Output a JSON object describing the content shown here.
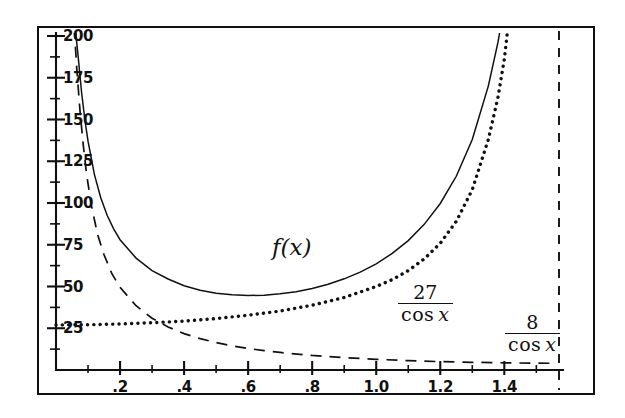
{
  "figure": {
    "kind": "function-plot",
    "background": "#ffffff",
    "ink_color": "#111111"
  },
  "annotations": {
    "fx": "f(x)",
    "curve27": {
      "numerator": "27",
      "denominator_fn": "cos",
      "denominator_var": "x"
    },
    "curve8": {
      "numerator": "8",
      "denominator_fn": "cos",
      "denominator_var": "x"
    }
  },
  "chart_data": {
    "type": "line",
    "title": "",
    "xlabel": "",
    "ylabel": "",
    "xlim": [
      0.0,
      1.5708
    ],
    "ylim": [
      0,
      205
    ],
    "grid": false,
    "legend": "inline-annotations",
    "x_ticks_major": [
      0.2,
      0.4,
      0.6,
      0.8,
      1.0,
      1.2,
      1.4
    ],
    "x_ticklabels": [
      ".2",
      ".4",
      ".6",
      ".8",
      "1.0",
      "1.2",
      "1.4"
    ],
    "x_ticks_minor": [
      0.1,
      0.3,
      0.5,
      0.7,
      0.9,
      1.1,
      1.3,
      1.5
    ],
    "y_ticks_major": [
      25,
      50,
      75,
      100,
      125,
      150,
      175,
      200
    ],
    "y_ticklabels": [
      "25",
      "50",
      "75",
      "100",
      "125",
      "150",
      "175",
      "200"
    ],
    "y_ticks_minor": [
      12.5,
      37.5,
      62.5,
      87.5,
      112.5,
      137.5,
      162.5,
      187.5
    ],
    "asymptote_x": 1.5708,
    "series": [
      {
        "name": "f(x)",
        "style": "solid",
        "label": "f(x)",
        "label_at": {
          "x": 0.73,
          "y": 72
        },
        "x": [
          0.06,
          0.07,
          0.08,
          0.09,
          0.1,
          0.12,
          0.14,
          0.16,
          0.18,
          0.2,
          0.25,
          0.3,
          0.35,
          0.4,
          0.45,
          0.5,
          0.55,
          0.6,
          0.65,
          0.7,
          0.75,
          0.8,
          0.85,
          0.9,
          0.95,
          1.0,
          1.05,
          1.1,
          1.15,
          1.2,
          1.25,
          1.3,
          1.35,
          1.38,
          1.4,
          1.42,
          1.44,
          1.45,
          1.46,
          1.47
        ],
        "y": [
          205.0,
          186.0,
          166.0,
          150.0,
          137.0,
          117.0,
          103.0,
          92.5,
          84.5,
          78.0,
          67.0,
          59.5,
          54.5,
          50.5,
          47.8,
          46.0,
          45.0,
          44.6,
          44.8,
          45.6,
          46.9,
          48.8,
          51.3,
          54.6,
          58.6,
          63.6,
          69.8,
          77.5,
          87.2,
          99.7,
          116.0,
          138.0,
          170.0,
          196.0,
          218.0,
          245.0,
          280.0,
          300.0,
          330.0,
          370.0
        ]
      },
      {
        "name": "27/cos(x)",
        "style": "dotted",
        "label": "27/cos x",
        "label_at": {
          "x": 1.17,
          "y": 38
        },
        "x": [
          0.0,
          0.1,
          0.2,
          0.3,
          0.4,
          0.5,
          0.6,
          0.7,
          0.8,
          0.9,
          1.0,
          1.05,
          1.1,
          1.15,
          1.2,
          1.25,
          1.3,
          1.35,
          1.38,
          1.4,
          1.42,
          1.44,
          1.45,
          1.46,
          1.47
        ],
        "y": [
          27.0,
          27.1,
          27.6,
          28.3,
          29.3,
          30.8,
          32.8,
          35.3,
          38.8,
          43.4,
          50.0,
          54.1,
          59.5,
          66.5,
          75.9,
          89.0,
          108.0,
          138.0,
          163.0,
          186.0,
          220.0,
          270.0,
          305.0,
          350.0,
          410.0
        ]
      },
      {
        "name": "8/cos(x)",
        "style": "dashed",
        "label": "8/cos x",
        "label_at": {
          "x": 1.41,
          "y": 19
        },
        "x": [
          0.057,
          0.065,
          0.075,
          0.085,
          0.095,
          0.11,
          0.13,
          0.15,
          0.175,
          0.2,
          0.25,
          0.3,
          0.35,
          0.4,
          0.45,
          0.5,
          0.55,
          0.6,
          0.65,
          0.7,
          0.8,
          0.9,
          1.0,
          1.1,
          1.2,
          1.3,
          1.4,
          1.5,
          1.56
        ],
        "y": [
          205.0,
          180.0,
          155.0,
          135.0,
          118.0,
          99.0,
          81.0,
          69.0,
          57.5,
          49.5,
          38.5,
          31.0,
          25.8,
          21.8,
          18.8,
          16.4,
          14.5,
          12.9,
          11.6,
          10.5,
          8.7,
          7.4,
          6.4,
          5.6,
          5.0,
          4.6,
          4.3,
          4.1,
          4.0
        ]
      }
    ]
  }
}
